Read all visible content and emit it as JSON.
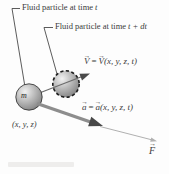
{
  "figure": {
    "type": "physics-diagram",
    "callouts": [
      {
        "prefix": "Fluid particle at time",
        "variable": "t"
      },
      {
        "prefix": "Fluid particle at time",
        "variable": "t + dt"
      }
    ],
    "equations": {
      "velocity": {
        "lhs": "V",
        "equals": "=",
        "rhs": "V",
        "args": "(x, y, z, t)"
      },
      "acceleration": {
        "lhs": "a",
        "equals": "=",
        "rhs": "a",
        "args": "(x, y, z, t)"
      }
    },
    "mass_label": "m",
    "position_label": "(x, y, z)",
    "force_label": "F",
    "colors": {
      "text": "#3b3b3b",
      "leader_line": "#4a4a4a",
      "motion_line": "#6b6b6b",
      "velocity_head": "#4a4a4a",
      "accel_arrow": "#8d8d8d",
      "accel_head": "#484848",
      "force_arrow": "#b0b0b0"
    }
  }
}
